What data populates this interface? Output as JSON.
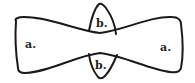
{
  "diagram": {
    "regions": [
      {
        "id": "left-lobe",
        "label": "a."
      },
      {
        "id": "right-lobe",
        "label": "a."
      },
      {
        "id": "top-waist-lobe",
        "label": "b."
      },
      {
        "id": "bottom-waist-lobe",
        "label": "b."
      }
    ],
    "colors": {
      "stroke": "#1a1a1a",
      "background": "#ffffff",
      "text": "#222222"
    }
  }
}
